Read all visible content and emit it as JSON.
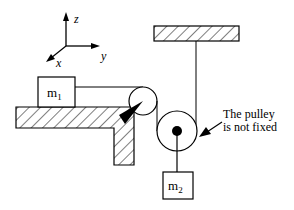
{
  "diagram": {
    "axes": {
      "z_label": "z",
      "y_label": "y",
      "x_label": "x"
    },
    "mass1": {
      "label": "m",
      "subscript": "1"
    },
    "mass2": {
      "label": "m",
      "subscript": "2"
    },
    "annotation": {
      "line1": "The pulley",
      "line2": "is not fixed"
    },
    "colors": {
      "stroke": "#000000",
      "background": "#ffffff"
    }
  }
}
